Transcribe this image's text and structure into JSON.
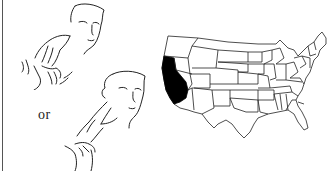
{
  "illustration": {
    "subject": "sign-language-california",
    "connector_text": "or",
    "figures": [
      {
        "id": "sign-variant-1",
        "description": "face with hand at ear and second hand below"
      },
      {
        "id": "sign-variant-2",
        "description": "face with hand at cheek and second hand below"
      }
    ]
  },
  "map": {
    "region": "United States",
    "highlighted_state": "California",
    "highlight_color": "#000000",
    "outline_color": "#222222",
    "fill_color": "#ffffff"
  }
}
